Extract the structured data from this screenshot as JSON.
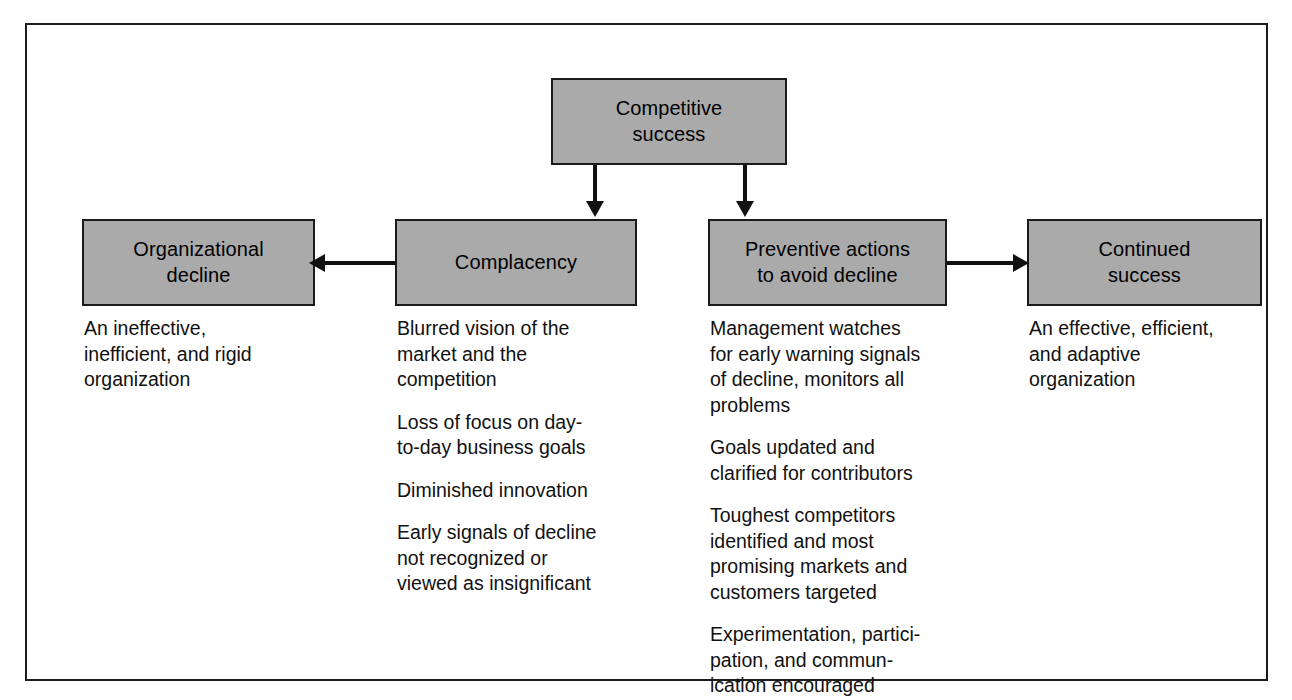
{
  "diagram": {
    "colors": {
      "box_fill": "#aaaaaa",
      "box_border": "#1b1b1b",
      "frame_border": "#1d1d1d",
      "connector": "#111111",
      "text": "#111111",
      "background": "#ffffff"
    },
    "nodes": {
      "competitive_success": {
        "label": "Competitive\nsuccess"
      },
      "organizational_decline": {
        "label": "Organizational\ndecline"
      },
      "complacency": {
        "label": "Complacency"
      },
      "preventive_actions": {
        "label": "Preventive actions\nto avoid decline"
      },
      "continued_success": {
        "label": "Continued\nsuccess"
      }
    },
    "connectors": [
      {
        "from": "competitive_success",
        "to": "complacency",
        "direction": "down"
      },
      {
        "from": "competitive_success",
        "to": "preventive_actions",
        "direction": "down"
      },
      {
        "from": "complacency",
        "to": "organizational_decline",
        "direction": "left"
      },
      {
        "from": "preventive_actions",
        "to": "continued_success",
        "direction": "right"
      }
    ],
    "columns": {
      "organizational_decline": {
        "items": [
          "An ineffective,\ninefficient, and rigid\norganization"
        ]
      },
      "complacency": {
        "items": [
          "Blurred vision of the\nmarket and the\ncompetition",
          "Loss of focus on day-\nto-day business goals",
          "Diminished innovation",
          "Early signals of decline\nnot recognized or\nviewed as insignificant"
        ]
      },
      "preventive_actions": {
        "items": [
          "Management watches\nfor early warning signals\nof decline, monitors all\nproblems",
          "Goals updated and\nclarified for contributors",
          "Toughest competitors\nidentified and most\npromising markets and\ncustomers targeted",
          "Experimentation, partici-\npation, and commun-\nication encouraged"
        ]
      },
      "continued_success": {
        "items": [
          "An effective, efficient,\nand adaptive\norganization"
        ]
      }
    }
  }
}
